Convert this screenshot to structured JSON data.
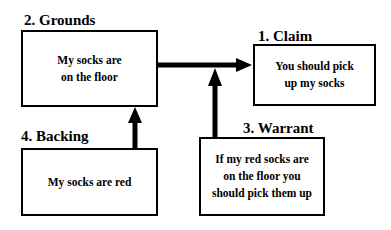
{
  "diagram": {
    "nodes": [
      {
        "id": "grounds",
        "label": "2.  Grounds",
        "text": "My socks are\non the floor"
      },
      {
        "id": "claim",
        "label": "1.  Claim",
        "text": "You should pick\nup my socks"
      },
      {
        "id": "warrant",
        "label": "3.  Warrant",
        "text": "If my red socks are\non the floor you\nshould pick them up"
      },
      {
        "id": "backing",
        "label": "4.  Backing",
        "text": "My socks are red"
      }
    ],
    "edges": [
      {
        "from": "grounds",
        "to": "claim"
      },
      {
        "from": "warrant",
        "to": "grounds-claim-arrow"
      },
      {
        "from": "backing",
        "to": "grounds"
      }
    ]
  }
}
